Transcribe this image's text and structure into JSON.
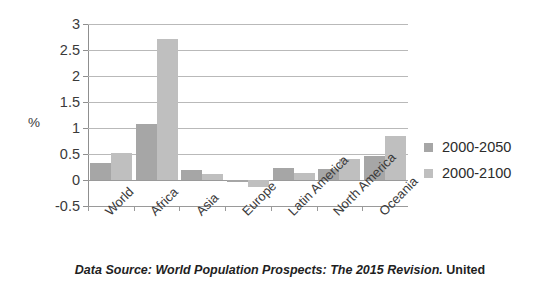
{
  "chart_data": {
    "type": "bar",
    "title": "",
    "subtitle": "",
    "xlabel": "",
    "ylabel": "%",
    "ylim": [
      -0.5,
      3
    ],
    "ytick_labels": [
      "3",
      "2.5",
      "2",
      "1.5",
      "1",
      "0.5",
      "0",
      "-0.5"
    ],
    "ytick_values": [
      3,
      2.5,
      2,
      1.5,
      1,
      0.5,
      0,
      -0.5
    ],
    "grid": true,
    "legend_position": "right",
    "categories": [
      "World",
      "Africa",
      "Asia",
      "Europe",
      "Latin America",
      "North America",
      "Oceania"
    ],
    "series": [
      {
        "name": "2000-2050",
        "color": "#a6a6a6",
        "values": [
          0.33,
          1.08,
          0.19,
          -0.03,
          0.24,
          0.21,
          0.47
        ]
      },
      {
        "name": "2000-2100",
        "color": "#bfbfbf",
        "values": [
          0.52,
          2.71,
          0.11,
          -0.13,
          0.14,
          0.41,
          0.84
        ]
      }
    ]
  },
  "caption": {
    "source_text": "Data Source: World Population Prospects: The 2015 Revision.",
    "organization": "United"
  }
}
